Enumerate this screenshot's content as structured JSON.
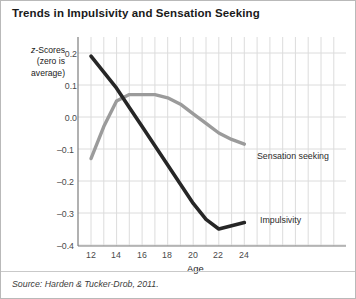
{
  "figure": {
    "title": "Trends in Impulsivity and Sensation Seeking",
    "source": "Source: Harden & Tucker-Drob, 2011.",
    "border_color": "#b9b9b9",
    "background": "#ffffff"
  },
  "chart_data": {
    "type": "line",
    "title": "Trends in Impulsivity and Sensation Seeking",
    "xlabel": "Age",
    "ylabel": "z-Scores (zero is average)",
    "ylabel_line1": "z-Scores",
    "ylabel_line2": "(zero is",
    "ylabel_line3": "average)",
    "xlim": [
      11,
      31
    ],
    "ylim": [
      -0.42,
      0.24
    ],
    "xticks": [
      12,
      14,
      16,
      18,
      20,
      22,
      24
    ],
    "xtick_labels": [
      "12",
      "14",
      "16",
      "18",
      "20",
      "22",
      "24"
    ],
    "yticks": [
      0.2,
      0.1,
      0.0,
      -0.1,
      -0.2,
      -0.3,
      -0.4
    ],
    "ytick_labels": [
      "0.2",
      "0.1",
      "0.0",
      "–0.1",
      "–0.2",
      "–0.3",
      "–0.4"
    ],
    "grid": true,
    "grid_color": "#dcdcdc",
    "legend": "inline-labels",
    "x": [
      12,
      13,
      14,
      15,
      16,
      17,
      18,
      19,
      20,
      21,
      22,
      23,
      24
    ],
    "series": [
      {
        "name": "Impulsivity",
        "color": "#262626",
        "label_x": 24.6,
        "label_y": -0.33,
        "values": [
          0.19,
          0.14,
          0.09,
          0.03,
          -0.03,
          -0.09,
          -0.15,
          -0.21,
          -0.27,
          -0.32,
          -0.35,
          -0.34,
          -0.33
        ]
      },
      {
        "name": "Sensation seeking",
        "color": "#9b9b9b",
        "label_x": 24.3,
        "label_y": -0.13,
        "values": [
          -0.13,
          -0.03,
          0.05,
          0.07,
          0.07,
          0.07,
          0.06,
          0.04,
          0.01,
          -0.02,
          -0.05,
          -0.07,
          -0.085
        ]
      }
    ]
  }
}
